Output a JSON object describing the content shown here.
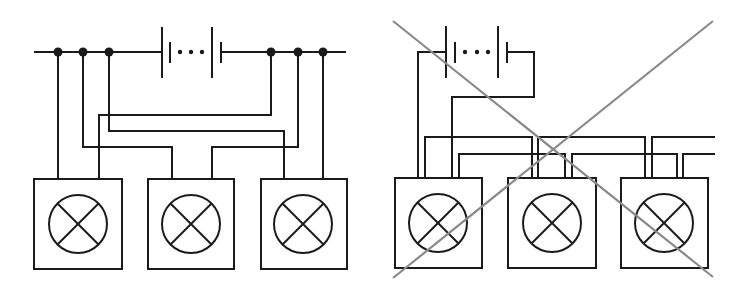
{
  "figure": {
    "panels": [
      {
        "id": "parallel-correct",
        "label": "",
        "bus_y": 52,
        "battery": {
          "long_plate_1_x": 162,
          "short_plate_1_x": 170,
          "dots_x": [
            180,
            191,
            202
          ],
          "long_plate_2_x": 212,
          "short_plate_2_x": 221,
          "long_plate_y": [
            27,
            78
          ],
          "short_plate_y": [
            42,
            63
          ]
        },
        "bus": {
          "x_start": 35,
          "x_end": 345
        },
        "junctions_x": [
          58,
          83,
          109,
          271,
          298,
          323
        ],
        "lamps": [
          {
            "name": "lamp-1",
            "box": [
              34,
              179,
              88,
              90
            ],
            "center": [
              78,
              224
            ],
            "r": 29
          },
          {
            "name": "lamp-2",
            "box": [
              148,
              179,
              86,
              90
            ],
            "center": [
              191,
              224
            ],
            "r": 29
          },
          {
            "name": "lamp-3",
            "box": [
              261,
              179,
              86,
              90
            ],
            "center": [
              303,
              224
            ],
            "r": 29
          }
        ],
        "wires": [
          "M58,52 L58,179",
          "M83,52 L83,147 L172,147 L172,179",
          "M109,52 L109,131 L284,131 L284,179",
          "M271,52 L271,115 L99,115 L99,179",
          "M298,52 L298,147 L212,147 L212,179",
          "M323,52 L323,179"
        ]
      },
      {
        "id": "series-incorrect",
        "label": "",
        "battery_wire_y": 52,
        "battery": {
          "long_plate_1_x": 446,
          "short_plate_1_x": 455,
          "dots_x": [
            465,
            477,
            488
          ],
          "long_plate_2_x": 498,
          "short_plate_2_x": 507,
          "long_plate_y": [
            26,
            78
          ],
          "short_plate_y": [
            42,
            63
          ]
        },
        "lamps": [
          {
            "name": "lamp-1",
            "box": [
              395,
              178,
              87,
              90
            ],
            "center": [
              438,
              223
            ],
            "r": 29
          },
          {
            "name": "lamp-2",
            "box": [
              508,
              178,
              88,
              90
            ],
            "center": [
              552,
              223
            ],
            "r": 29
          },
          {
            "name": "lamp-3",
            "box": [
              621,
              178,
              87,
              90
            ],
            "center": [
              664,
              223
            ],
            "r": 29
          }
        ],
        "wires": [
          "M446,52 L418,52 L418,178",
          "M507,52 L534,52 L534,97 L452,97 L452,178",
          "M425,178 L425,137 L532,137 L532,178",
          "M459,178 L459,154 L565,154 L565,178",
          "M538,178 L538,137 L645,137 L645,178",
          "M572,178 L572,154 L677,154 L677,178",
          "M652,178 L652,137 L714,137",
          "M683,178 L683,154 L714,154"
        ],
        "cross_out": {
          "color": "#8a8a8a",
          "lines": [
            [
              393,
              21,
              713,
              277
            ],
            [
              713,
              21,
              393,
              278
            ]
          ]
        }
      }
    ],
    "colors": {
      "line": "#1a1a1a",
      "cross": "#8a8a8a",
      "background": "#ffffff"
    }
  }
}
